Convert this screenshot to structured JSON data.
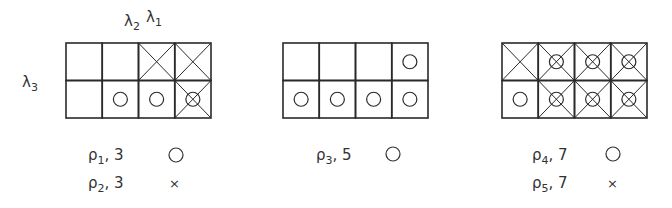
{
  "diagrams": [
    {
      "id": "left",
      "top_label": {
        "symbols": [
          "λ",
          "λ"
        ],
        "subs": [
          "2",
          "1"
        ]
      },
      "side_label": {
        "symbol": "λ",
        "sub": "3"
      },
      "grid": {
        "rows": 2,
        "cols": 4,
        "cells": [
          [
            {
              "x": false,
              "o": false
            },
            {
              "x": false,
              "o": false
            },
            {
              "x": true,
              "o": false
            },
            {
              "x": true,
              "o": false
            }
          ],
          [
            {
              "x": false,
              "o": false
            },
            {
              "x": false,
              "o": true
            },
            {
              "x": false,
              "o": true
            },
            {
              "x": true,
              "o": true
            }
          ]
        ]
      },
      "legend": [
        {
          "rho": "ρ",
          "sub": "1",
          "value": "3",
          "marker": "circle"
        },
        {
          "rho": "ρ",
          "sub": "2",
          "value": "3",
          "marker": "×"
        }
      ]
    },
    {
      "id": "middle",
      "grid": {
        "rows": 2,
        "cols": 4,
        "cells": [
          [
            {
              "x": false,
              "o": false
            },
            {
              "x": false,
              "o": false
            },
            {
              "x": false,
              "o": false
            },
            {
              "x": false,
              "o": true
            }
          ],
          [
            {
              "x": false,
              "o": true
            },
            {
              "x": false,
              "o": true
            },
            {
              "x": false,
              "o": true
            },
            {
              "x": false,
              "o": true
            }
          ]
        ]
      },
      "legend": [
        {
          "rho": "ρ",
          "sub": "3",
          "value": "5",
          "marker": "circle"
        }
      ]
    },
    {
      "id": "right",
      "grid": {
        "rows": 2,
        "cols": 4,
        "cells": [
          [
            {
              "x": true,
              "o": false
            },
            {
              "x": true,
              "o": true
            },
            {
              "x": true,
              "o": true
            },
            {
              "x": true,
              "o": true
            }
          ],
          [
            {
              "x": false,
              "o": true
            },
            {
              "x": true,
              "o": true
            },
            {
              "x": true,
              "o": true
            },
            {
              "x": true,
              "o": true
            }
          ]
        ]
      },
      "legend": [
        {
          "rho": "ρ",
          "sub": "4",
          "value": "7",
          "marker": "circle"
        },
        {
          "rho": "ρ",
          "sub": "5",
          "value": "7",
          "marker": "×"
        }
      ]
    }
  ],
  "colors": {
    "stroke": "#2a2a2a",
    "background": "#ffffff"
  }
}
